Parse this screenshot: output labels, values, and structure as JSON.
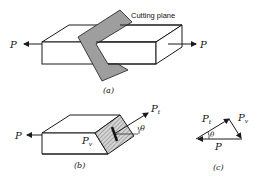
{
  "figure": {
    "panel_a": {
      "caption": "(a)",
      "cutting_plane_label": "Cutting plane",
      "force_left": "P",
      "force_right": "P"
    },
    "panel_b": {
      "caption": "(b)",
      "force_left": "P",
      "force_tangential": "P",
      "force_tangential_sub": "t",
      "force_normal": "P",
      "force_normal_sub": "v",
      "angle": "θ"
    },
    "panel_c": {
      "caption": "(c)",
      "side_pt": "P",
      "side_pt_sub": "t",
      "side_pv": "P",
      "side_pv_sub": "v",
      "side_p": "P",
      "angle": "θ"
    }
  },
  "colors": {
    "line": "#1a1a1a",
    "plane_fill": "#9e9e9e",
    "hatch": "#555555"
  }
}
